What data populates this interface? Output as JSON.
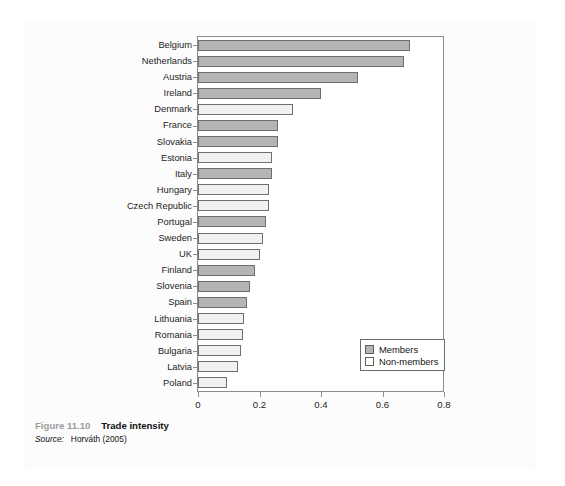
{
  "caption": {
    "figure_number": "Figure 11.10",
    "figure_title": "Trade intensity",
    "source_label": "Source:",
    "source_text": "Horváth (2005)"
  },
  "legend": {
    "position": "bottom-right",
    "entries": [
      {
        "label": "Members",
        "color": "#b4b4b4"
      },
      {
        "label": "Non-members",
        "color": "#ffffff"
      }
    ]
  },
  "chart_data": {
    "type": "bar",
    "orientation": "horizontal",
    "title": "Trade intensity",
    "xlabel": "",
    "ylabel": "",
    "xlim": [
      0,
      0.8
    ],
    "xticks": [
      "0",
      "0.2",
      "0.4",
      "0.6",
      "0.8"
    ],
    "xtick_values": [
      0,
      0.2,
      0.4,
      0.6,
      0.8
    ],
    "grid": false,
    "categories": [
      "Belgium",
      "Netherlands",
      "Austria",
      "Ireland",
      "Denmark",
      "France",
      "Slovakia",
      "Estonia",
      "Italy",
      "Hungary",
      "Czech Republic",
      "Portugal",
      "Sweden",
      "UK",
      "Finland",
      "Slovenia",
      "Spain",
      "Lithuania",
      "Romania",
      "Bulgaria",
      "Latvia",
      "Poland"
    ],
    "values": [
      0.69,
      0.67,
      0.52,
      0.4,
      0.31,
      0.26,
      0.26,
      0.24,
      0.24,
      0.23,
      0.23,
      0.22,
      0.21,
      0.2,
      0.185,
      0.17,
      0.16,
      0.15,
      0.145,
      0.14,
      0.13,
      0.095
    ],
    "groups": [
      "Members",
      "Members",
      "Members",
      "Members",
      "Non-members",
      "Members",
      "Members",
      "Non-members",
      "Members",
      "Non-members",
      "Non-members",
      "Members",
      "Non-members",
      "Non-members",
      "Members",
      "Members",
      "Members",
      "Non-members",
      "Non-members",
      "Non-members",
      "Non-members",
      "Non-members"
    ]
  }
}
